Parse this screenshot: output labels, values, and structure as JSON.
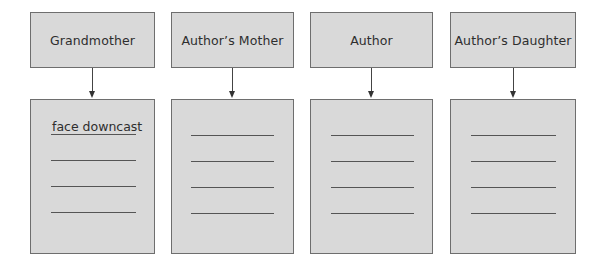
{
  "diagram": {
    "columns": [
      {
        "heading": "Grandmother",
        "lines": [
          "face downcast",
          "",
          "",
          ""
        ]
      },
      {
        "heading": "Author’s Mother",
        "lines": [
          "",
          "",
          "",
          ""
        ]
      },
      {
        "heading": "Author",
        "lines": [
          "",
          "",
          "",
          ""
        ]
      },
      {
        "heading": "Author’s Daughter",
        "lines": [
          "",
          "",
          "",
          ""
        ]
      }
    ],
    "colors": {
      "box_fill": "#d9d9d9",
      "box_border": "#6e6e6e",
      "arrow": "#333333",
      "rule_line": "#555555"
    }
  }
}
